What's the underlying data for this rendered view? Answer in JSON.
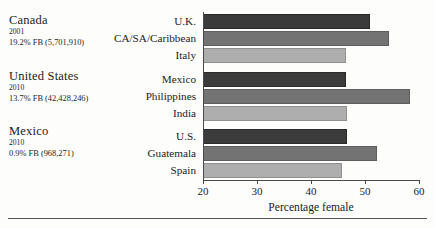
{
  "panels": [
    {
      "country": "Canada",
      "year": "2001",
      "fb": "19.2% FB (5,701,910)"
    },
    {
      "country": "United States",
      "year": "2010",
      "fb": "13.7% FB (42,428,246)"
    },
    {
      "country": "Mexico",
      "year": "2010",
      "fb": "0.9% FB (968,271)"
    }
  ],
  "chart_data": {
    "type": "bar",
    "orientation": "horizontal",
    "title": "",
    "xlabel": "Percentage female",
    "ylabel": "",
    "xlim": [
      20,
      60
    ],
    "xticks": [
      20,
      30,
      40,
      50,
      60
    ],
    "xtick_labels": [
      "20",
      "30",
      "40",
      "50",
      "60"
    ],
    "grid": false,
    "legend": "none",
    "groups": [
      {
        "group_label": "Canada",
        "categories": [
          "U.K.",
          "CA/SA/Caribbean",
          "Italy"
        ],
        "values": [
          50.9,
          54.4,
          46.4
        ]
      },
      {
        "group_label": "United States",
        "categories": [
          "Mexico",
          "Philippines",
          "India"
        ],
        "values": [
          46.4,
          58.3,
          46.7
        ]
      },
      {
        "group_label": "Mexico",
        "categories": [
          "U.S.",
          "Guatemala",
          "Spain"
        ],
        "values": [
          46.6,
          52.3,
          45.8
        ]
      }
    ],
    "bar_colors": [
      "#3b3b3b",
      "#737373",
      "#aeaeae"
    ]
  },
  "labels": {
    "g0c0": "U.K.",
    "g0c1": "CA/SA/Caribbean",
    "g0c2": "Italy",
    "g1c0": "Mexico",
    "g1c1": "Philippines",
    "g1c2": "India",
    "g2c0": "U.S.",
    "g2c1": "Guatemala",
    "g2c2": "Spain"
  },
  "ticks": {
    "t0": "20",
    "t1": "30",
    "t2": "40",
    "t3": "50",
    "t4": "60"
  }
}
